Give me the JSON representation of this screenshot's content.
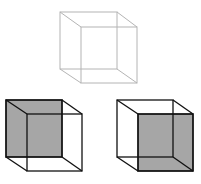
{
  "colors": {
    "background": "#ffffff",
    "outline_cube_stroke": "#b4b4b4",
    "solid_stroke": "#111111",
    "shade_fill": "#a6a6a6"
  },
  "cubes": [
    {
      "id": "ambiguous",
      "description": "Ambiguous wireframe cube (no shading)",
      "back": {
        "x1": 60,
        "y1": 12,
        "x2": 117,
        "y2": 69
      },
      "front": {
        "x1": 81,
        "y1": 27,
        "x2": 137,
        "y2": 83
      },
      "shaded_face": "none"
    },
    {
      "id": "interpretation-left",
      "description": "Interpretation with back face shaded (viewed from above-right)",
      "back": {
        "x1": 6,
        "y1": 100,
        "x2": 62,
        "y2": 157
      },
      "front": {
        "x1": 27,
        "y1": 114,
        "x2": 82,
        "y2": 171
      },
      "shaded_face": "back"
    },
    {
      "id": "interpretation-right",
      "description": "Interpretation with front face shaded",
      "back": {
        "x1": 117,
        "y1": 100,
        "x2": 173,
        "y2": 157
      },
      "front": {
        "x1": 138,
        "y1": 114,
        "x2": 193,
        "y2": 171
      },
      "shaded_face": "front"
    }
  ]
}
